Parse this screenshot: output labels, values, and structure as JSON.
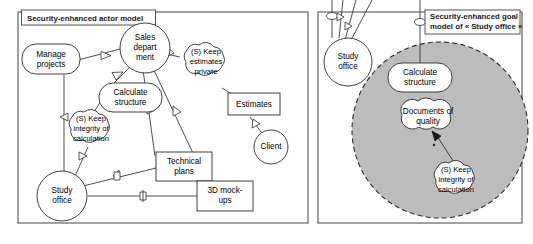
{
  "figure": {
    "kind": "uml-style security-enhanced models",
    "panels": [
      {
        "id": "actor-model",
        "title": "Security-enhanced actor model",
        "nodes": [
          {
            "id": "manage-projects",
            "label": "Manage projects",
            "lines": [
              "Manage",
              "projects"
            ],
            "shape": "rounded-rect"
          },
          {
            "id": "sales-department",
            "label": "Sales department",
            "lines": [
              "Sales",
              "depart",
              "ment"
            ],
            "shape": "circle"
          },
          {
            "id": "keep-estimates",
            "label": "(S) Keep estimates private",
            "lines": [
              "(S) Keep",
              "estimates",
              "private"
            ],
            "shape": "cloud"
          },
          {
            "id": "calculate-structure",
            "label": "Calculate structure",
            "lines": [
              "Calculate",
              "structure"
            ],
            "shape": "rounded-rect"
          },
          {
            "id": "estimates",
            "label": "Estimates",
            "lines": [
              "Estimates"
            ],
            "shape": "rect"
          },
          {
            "id": "client",
            "label": "Client",
            "lines": [
              "Client"
            ],
            "shape": "circle"
          },
          {
            "id": "keep-integrity",
            "label": "(S) Keep integrity of calculation",
            "lines": [
              "(S) Keep",
              "integrity of",
              "calculation"
            ],
            "shape": "cloud"
          },
          {
            "id": "technical-plans",
            "label": "Technical plans",
            "lines": [
              "Technical",
              "plans"
            ],
            "shape": "rect"
          },
          {
            "id": "study-office",
            "label": "Study office",
            "lines": [
              "Study",
              "office"
            ],
            "shape": "circle"
          },
          {
            "id": "3d-mockups",
            "label": "3D mock-ups",
            "lines": [
              "3D mock-",
              "ups"
            ],
            "shape": "rect"
          }
        ]
      },
      {
        "id": "goal-model",
        "title_prefix": "Security-enhanced goal",
        "title_line2_prefix": "model of « ",
        "title_italic": "Study office",
        "title_line2_suffix": " »",
        "title": "Security-enhanced goal model of « Study office »",
        "nodes": [
          {
            "id": "study-office-r",
            "label": "Study office",
            "lines": [
              "Study",
              "office"
            ],
            "shape": "circle"
          },
          {
            "id": "calculate-structure-r",
            "label": "Calculate structure",
            "lines": [
              "Calculate",
              "structure"
            ],
            "shape": "rounded-rect"
          },
          {
            "id": "documents-quality",
            "label": "Documents of quality",
            "lines": [
              "Documents of",
              "quality"
            ],
            "shape": "wavy"
          },
          {
            "id": "keep-integrity-r",
            "label": "(S) Keep integrity of calculation",
            "lines": [
              "(S) Keep",
              "integrity of",
              "calculation"
            ],
            "shape": "cloud"
          }
        ],
        "scope_fill": "#bcbcbc"
      }
    ],
    "colors": {
      "ink": "#2b2b2b",
      "line": "#3a3a3a",
      "panel_border": "#545454",
      "scope_gray": "#bcbcbc",
      "paper": "#ffffff"
    }
  }
}
